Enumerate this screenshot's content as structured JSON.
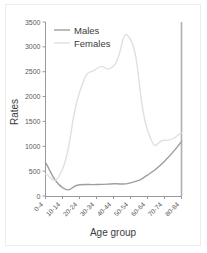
{
  "chart_data": {
    "type": "line",
    "title": "",
    "xlabel": "Age group",
    "ylabel": "Rates",
    "categories": [
      "0-4",
      "10-14",
      "20-24",
      "30-34",
      "40-44",
      "50-54",
      "60-64",
      "70-74",
      "80-84"
    ],
    "x_tick_labels": [
      "0-4",
      "10-14",
      "20-24",
      "30-34",
      "40-44",
      "50-54",
      "60-64",
      "70-74",
      "80-84"
    ],
    "y_tick_labels": [
      "0",
      "500",
      "1000",
      "1500",
      "2000",
      "2500",
      "3000",
      "3500"
    ],
    "y_ticks": [
      0,
      500,
      1000,
      1500,
      2000,
      2500,
      3000,
      3500
    ],
    "ylim": [
      0,
      3500
    ],
    "grid": false,
    "legend_position": "top-left",
    "series": [
      {
        "name": "Males",
        "color": "#9e9e9e",
        "values": [
          670,
          170,
          225,
          230,
          245,
          265,
          420,
          700,
          1090
        ]
      },
      {
        "name": "Females",
        "color": "#e0e0e0",
        "values": [
          440,
          540,
          2080,
          2560,
          2610,
          3150,
          1330,
          1120,
          1270
        ]
      }
    ]
  },
  "legend": {
    "entries": [
      {
        "label": "Males"
      },
      {
        "label": "Females"
      }
    ]
  },
  "axes": {
    "y_title": "Rates",
    "x_title": "Age group"
  },
  "colors": {
    "males": "#9e9e9e",
    "females": "#e0e0e0",
    "axis": "#9a9a9a",
    "text": "#3c3c3c",
    "border": "#ededed"
  }
}
